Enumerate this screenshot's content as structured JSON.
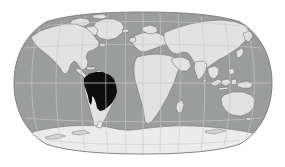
{
  "figure": {
    "kind": "world-locator-map",
    "projection": "Robinson",
    "background_color": "#ffffff",
    "width": 285,
    "height": 167
  },
  "map": {
    "ocean_color": "#9b9c9c",
    "land_color": "#e2e2e2",
    "highlight_color": "#0d0d0d",
    "coastline_color": "#6e6f6f",
    "graticule_color": "#c9cacA",
    "frame_color": "#7a7b7b",
    "antarctica_color": "#ececec",
    "globe": {
      "center_x": 143,
      "center_y": 83,
      "radius_x": 129,
      "radius_y": 70
    }
  },
  "highlight": {
    "label": "South America",
    "sublabel": "Amazon basin region",
    "color": "#0d0d0d",
    "countries": [
      "Brazil",
      "Bolivia",
      "Peru",
      "Colombia",
      "Venezuela",
      "Ecuador",
      "Guyana",
      "Suriname",
      "French Guiana"
    ]
  },
  "landmasses": [
    {
      "name": "North America",
      "highlighted": false
    },
    {
      "name": "South America",
      "highlighted": true
    },
    {
      "name": "Europe",
      "highlighted": false
    },
    {
      "name": "Africa",
      "highlighted": false
    },
    {
      "name": "Asia",
      "highlighted": false
    },
    {
      "name": "Australia",
      "highlighted": false
    },
    {
      "name": "Antarctica",
      "highlighted": false
    },
    {
      "name": "Greenland",
      "highlighted": false
    }
  ],
  "graticule": {
    "visible": true,
    "parallel_spacing_degrees": 30,
    "meridian_spacing_degrees": 30,
    "parallels": [
      -60,
      -30,
      0,
      30,
      60
    ],
    "meridians": [
      -150,
      -120,
      -90,
      -60,
      -30,
      0,
      30,
      60,
      90,
      120,
      150
    ]
  }
}
